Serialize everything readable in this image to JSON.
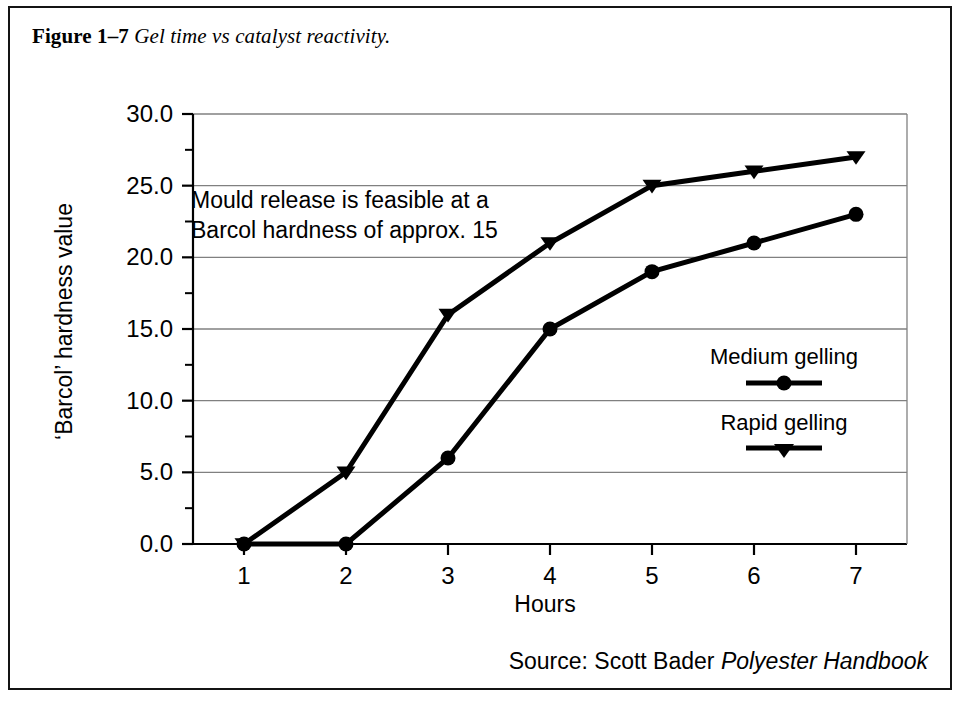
{
  "figure": {
    "label": "Figure 1–7",
    "title": "Gel time vs catalyst reactivity.",
    "source_prefix": "Source: Scott Bader",
    "source_title": "Polyester Handbook"
  },
  "annotation": {
    "line1": "Mould release is feasible at a",
    "line2": "Barcol hardness of approx. 15"
  },
  "legend": {
    "medium_label": "Medium gelling",
    "rapid_label": "Rapid gelling"
  },
  "axes": {
    "x_title": "Hours",
    "y_title": "‘Barcol’ hardness value"
  },
  "chart_data": {
    "type": "line",
    "title": "Gel time vs catalyst reactivity.",
    "xlabel": "Hours",
    "ylabel": "'Barcol' hardness value",
    "x": [
      1,
      2,
      3,
      4,
      5,
      6,
      7
    ],
    "xticklabels": [
      "1",
      "2",
      "3",
      "4",
      "5",
      "6",
      "7"
    ],
    "xlim": [
      0.5,
      7.5
    ],
    "ylim": [
      0.0,
      30.0
    ],
    "yticks": [
      0.0,
      5.0,
      10.0,
      15.0,
      20.0,
      25.0,
      30.0
    ],
    "yticklabels": [
      "0.0",
      "5.0",
      "10.0",
      "15.0",
      "20.0",
      "25.0",
      "30.0"
    ],
    "y_minor_ticks": [
      2.5,
      7.5,
      12.5,
      17.5,
      22.5,
      27.5
    ],
    "grid": "horizontal",
    "legend_position": "center-right",
    "series": [
      {
        "name": "Medium gelling",
        "marker": "circle",
        "color": "#000000",
        "values": [
          0,
          0,
          6,
          15,
          19,
          21,
          23
        ]
      },
      {
        "name": "Rapid gelling",
        "marker": "triangle-down",
        "color": "#000000",
        "values": [
          0,
          5,
          16,
          21,
          25,
          26,
          27
        ]
      }
    ],
    "annotations": [
      "Mould release is feasible at a",
      "Barcol hardness of approx. 15"
    ]
  },
  "colors": {
    "ink": "#000000",
    "frame": "#141414",
    "gridline": "#808080",
    "background": "#ffffff"
  }
}
